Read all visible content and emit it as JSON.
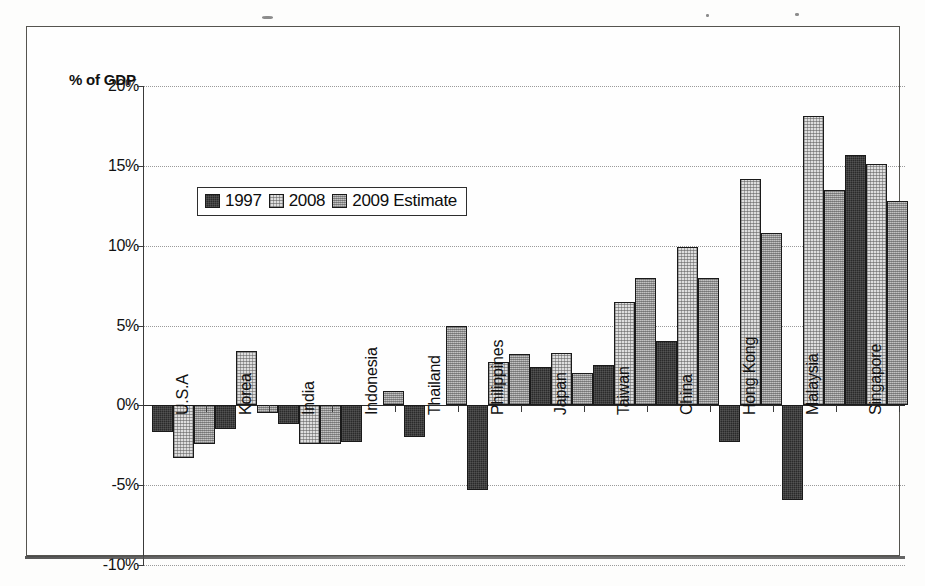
{
  "axis_caption": "% of GDP",
  "legend": {
    "items": [
      {
        "label": "1997",
        "series": "s1997",
        "color": "#2a2a2a"
      },
      {
        "label": "2008",
        "series": "s2008",
        "color": "#dedede"
      },
      {
        "label": "2009 Estimate",
        "series": "s2009",
        "color": "#a8a8a8"
      }
    ]
  },
  "y_ticks": [
    "20%",
    "15%",
    "10%",
    "5%",
    "0%",
    "-5%",
    "-10%"
  ],
  "chart_data": {
    "type": "bar",
    "title": "",
    "subtitle": "",
    "xlabel": "",
    "ylabel": "% of GDP",
    "ylim": [
      -10,
      20
    ],
    "ytick_step": 5,
    "grid": true,
    "legend_position": "inside-upper-left",
    "categories": [
      "U.S.A",
      "Korea",
      "India",
      "Indonesia",
      "Thailand",
      "Philippines",
      "Japan",
      "Taiwan",
      "China",
      "Hong Kong",
      "Malaysia",
      "Singapore"
    ],
    "series": [
      {
        "name": "1997",
        "values": [
          -1.7,
          -1.5,
          -1.2,
          -2.3,
          -2.0,
          -5.3,
          2.4,
          2.5,
          4.0,
          -2.3,
          -5.9,
          15.7
        ]
      },
      {
        "name": "2008",
        "values": [
          -3.3,
          3.4,
          -2.4,
          0.0,
          0.0,
          2.7,
          3.3,
          6.5,
          9.9,
          14.2,
          18.1,
          15.1
        ]
      },
      {
        "name": "2009 Estimate",
        "values": [
          -2.4,
          -0.5,
          -2.4,
          0.9,
          5.0,
          3.2,
          2.0,
          8.0,
          8.0,
          10.8,
          13.5,
          12.8
        ]
      }
    ]
  }
}
